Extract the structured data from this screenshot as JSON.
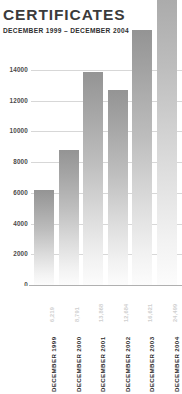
{
  "chart_data": {
    "type": "bar",
    "title": "CERTIFICATES",
    "subtitle": "DECEMBER 1999 – DECEMBER 2004",
    "xlabel": "",
    "ylabel": "",
    "categories": [
      "DECEMBER 1999",
      "DECEMBER 2000",
      "DECEMBER 2001",
      "DECEMBER 2002",
      "DECEMBER 2003",
      "DECEMBER 2004"
    ],
    "values": [
      6219,
      8791,
      13868,
      12684,
      16621,
      24499
    ],
    "value_labels": [
      "6,219",
      "8,791",
      "13,868",
      "12,684",
      "16,621",
      "24,499"
    ],
    "ylim": [
      0,
      14000
    ],
    "yticks": [
      0,
      2000,
      4000,
      6000,
      8000,
      10000,
      12000,
      14000
    ],
    "ytick_labels": [
      "0",
      "2000",
      "4000",
      "6000",
      "8000",
      "10000",
      "12000",
      "14000"
    ],
    "grid": true,
    "legend": false,
    "note_bars_overflow_axis": true,
    "colors": {
      "bar_top": "#949494",
      "bar_bottom": "#fcfcfc",
      "gridline": "#d7d7d7",
      "baseline": "#b0b0b0",
      "title_text": "#3b3b3b",
      "axis_text": "#4a4a4a",
      "value_label_text": "#cfcfcf",
      "background": "#ffffff"
    }
  }
}
